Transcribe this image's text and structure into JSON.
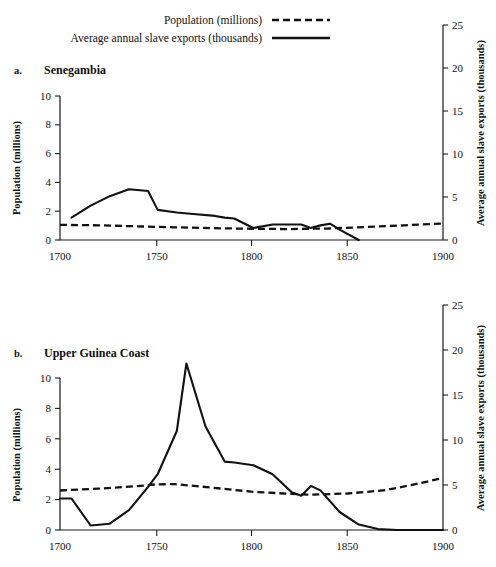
{
  "legend": {
    "position": "top",
    "entries": [
      {
        "label": "Population (millions)",
        "style": "dashed"
      },
      {
        "label": "Average annual slave exports (thousands)",
        "style": "solid"
      }
    ]
  },
  "axis_titles": {
    "left": "Population (millions)",
    "right": "Average annual slave exports (thousands)"
  },
  "panels": [
    {
      "letter": "a.",
      "title": "Senegambia",
      "x_ticks": [
        "1700",
        "1750",
        "1800",
        "1850",
        "1900"
      ],
      "y_left_ticks": [
        "0",
        "2",
        "4",
        "6",
        "8",
        "10"
      ],
      "y_right_ticks": [
        "0",
        "5",
        "10",
        "15",
        "20",
        "25"
      ]
    },
    {
      "letter": "b.",
      "title": "Upper Guinea Coast",
      "x_ticks": [
        "1700",
        "1750",
        "1800",
        "1850",
        "1900"
      ],
      "y_left_ticks": [
        "0",
        "2",
        "4",
        "6",
        "8",
        "10"
      ],
      "y_right_ticks": [
        "0",
        "5",
        "10",
        "15",
        "20",
        "25"
      ]
    }
  ],
  "chart_data": [
    {
      "type": "line",
      "title": "a. Senegambia",
      "xlabel": "",
      "ylabel": "Population (millions)",
      "y2label": "Average annual slave exports (thousands)",
      "xlim": [
        1700,
        1900
      ],
      "ylim": [
        0,
        10
      ],
      "y2lim": [
        0,
        25
      ],
      "grid": false,
      "legend_position": "top",
      "series": [
        {
          "name": "Average annual slave exports (thousands)",
          "style": "solid",
          "axis": "right",
          "x": [
            1706,
            1716,
            1726,
            1736,
            1746,
            1751,
            1761,
            1771,
            1781,
            1786,
            1791,
            1801,
            1811,
            1821,
            1826,
            1831,
            1836,
            1841,
            1846,
            1856
          ],
          "values": [
            2.6,
            4.0,
            5.1,
            5.9,
            5.7,
            3.5,
            3.2,
            3.0,
            2.8,
            2.6,
            2.5,
            1.4,
            1.8,
            1.8,
            1.8,
            1.4,
            1.7,
            1.9,
            1.2,
            0.0
          ]
        },
        {
          "name": "Population (millions)",
          "style": "dashed",
          "axis": "left",
          "x": [
            1700,
            1720,
            1740,
            1760,
            1780,
            1800,
            1820,
            1840,
            1860,
            1880,
            1900
          ],
          "values": [
            1.05,
            1.02,
            0.95,
            0.88,
            0.82,
            0.78,
            0.76,
            0.8,
            0.9,
            1.02,
            1.15
          ]
        }
      ]
    },
    {
      "type": "line",
      "title": "b. Upper Guinea Coast",
      "xlabel": "",
      "ylabel": "Population (millions)",
      "y2label": "Average annual slave exports (thousands)",
      "xlim": [
        1700,
        1900
      ],
      "ylim": [
        0,
        10
      ],
      "y2lim": [
        0,
        25
      ],
      "grid": false,
      "legend_position": "top",
      "series": [
        {
          "name": "Average annual slave exports (thousands)",
          "style": "solid",
          "axis": "right",
          "x": [
            1700,
            1706,
            1716,
            1726,
            1736,
            1746,
            1751,
            1761,
            1766,
            1776,
            1786,
            1791,
            1801,
            1811,
            1821,
            1826,
            1831,
            1836,
            1846,
            1856,
            1866,
            1876,
            1900
          ],
          "values": [
            3.5,
            3.5,
            0.5,
            0.7,
            2.2,
            4.8,
            6.2,
            11.0,
            18.5,
            11.5,
            7.6,
            7.5,
            7.2,
            6.2,
            4.2,
            3.8,
            4.9,
            4.4,
            2.0,
            0.6,
            0.1,
            0.0,
            0.0
          ]
        },
        {
          "name": "Population (millions)",
          "style": "dashed",
          "axis": "left",
          "x": [
            1700,
            1720,
            1740,
            1750,
            1760,
            1780,
            1800,
            1820,
            1830,
            1850,
            1870,
            1885,
            1900
          ],
          "values": [
            2.6,
            2.72,
            2.88,
            3.0,
            3.02,
            2.78,
            2.52,
            2.38,
            2.32,
            2.4,
            2.62,
            3.0,
            3.42
          ]
        }
      ]
    }
  ]
}
